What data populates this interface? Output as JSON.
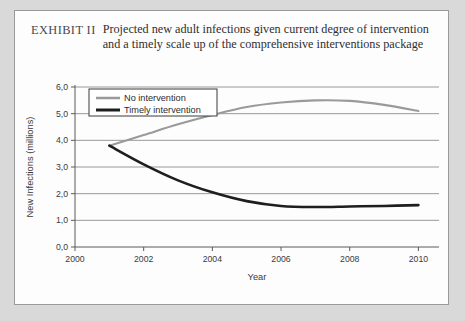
{
  "figure": {
    "exhibit_label": "EXHIBIT II",
    "caption": "Projected new adult infections given current degree of intervention and a timely scale up of the comprehensive interventions package"
  },
  "chart_data": {
    "type": "line",
    "title": "",
    "xlabel": "Year",
    "ylabel": "New Infections (millions)",
    "xlim": [
      2000,
      2010.6
    ],
    "ylim": [
      0,
      6
    ],
    "xticks": [
      2000,
      2002,
      2004,
      2006,
      2008,
      2010
    ],
    "xtick_labels": [
      "2000",
      "2002",
      "2004",
      "2006",
      "2008",
      "2010"
    ],
    "yticks": [
      0,
      1,
      2,
      3,
      4,
      5,
      6
    ],
    "ytick_labels": [
      "0,0",
      "1,0",
      "2,0",
      "3,0",
      "4,0",
      "5,0",
      "6,0"
    ],
    "grid": "horizontal",
    "legend_position": "top-left",
    "x": [
      2001,
      2002,
      2003,
      2004,
      2005,
      2006,
      2007,
      2008,
      2009,
      2010
    ],
    "series": [
      {
        "name": "No intervention",
        "color": "#9a9a9a",
        "width": 2.1,
        "values": [
          3.8,
          4.2,
          4.6,
          4.95,
          5.25,
          5.42,
          5.5,
          5.48,
          5.33,
          5.1
        ]
      },
      {
        "name": "Timely intervention",
        "color": "#1e1e1e",
        "width": 2.6,
        "values": [
          3.8,
          3.1,
          2.5,
          2.05,
          1.72,
          1.54,
          1.5,
          1.52,
          1.54,
          1.57
        ]
      }
    ]
  }
}
